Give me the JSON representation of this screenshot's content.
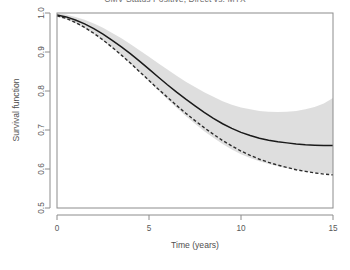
{
  "chart_data": {
    "type": "line",
    "title": "CMV Status Positive, Direct vs. MTX",
    "xlabel": "Time (years)",
    "ylabel": "Survival function",
    "xlim": [
      0,
      15
    ],
    "ylim": [
      0.5,
      1.0
    ],
    "xticks": [
      0,
      5,
      10,
      15
    ],
    "xtick_labels": [
      "0",
      "5",
      "10",
      "15"
    ],
    "yticks": [
      0.5,
      0.6,
      0.7,
      0.8,
      0.9,
      1.0
    ],
    "ytick_labels": [
      "0.5",
      "0.6",
      "0.7",
      "0.8",
      "0.9",
      "1.0"
    ],
    "grid": false,
    "legend": null,
    "x": [
      0,
      0.5,
      1,
      1.5,
      2,
      2.5,
      3,
      3.5,
      4,
      4.5,
      5,
      5.5,
      6,
      6.5,
      7,
      7.5,
      8,
      8.5,
      9,
      9.5,
      10,
      10.5,
      11,
      11.5,
      12,
      12.5,
      13,
      13.5,
      14,
      14.5,
      15
    ],
    "series": [
      {
        "name": "Direct",
        "style": "solid",
        "color": "#1a1a1a",
        "values": [
          0.995,
          0.99,
          0.982,
          0.972,
          0.96,
          0.946,
          0.93,
          0.913,
          0.895,
          0.876,
          0.856,
          0.836,
          0.816,
          0.797,
          0.779,
          0.762,
          0.745,
          0.73,
          0.716,
          0.704,
          0.694,
          0.686,
          0.679,
          0.674,
          0.67,
          0.667,
          0.664,
          0.662,
          0.661,
          0.66,
          0.66
        ]
      },
      {
        "name": "MTX",
        "style": "dashed",
        "color": "#2b2b2b",
        "values": [
          0.993,
          0.986,
          0.976,
          0.963,
          0.948,
          0.931,
          0.912,
          0.892,
          0.871,
          0.849,
          0.827,
          0.805,
          0.784,
          0.763,
          0.743,
          0.724,
          0.706,
          0.689,
          0.673,
          0.659,
          0.646,
          0.635,
          0.625,
          0.617,
          0.61,
          0.604,
          0.598,
          0.594,
          0.59,
          0.587,
          0.585
        ]
      }
    ],
    "confidence_band": {
      "series": "Direct",
      "color": "#d8d8d8",
      "upper": [
        0.999,
        0.996,
        0.99,
        0.983,
        0.973,
        0.962,
        0.949,
        0.935,
        0.92,
        0.904,
        0.888,
        0.871,
        0.855,
        0.839,
        0.824,
        0.81,
        0.797,
        0.785,
        0.774,
        0.765,
        0.758,
        0.753,
        0.749,
        0.747,
        0.746,
        0.747,
        0.749,
        0.753,
        0.759,
        0.768,
        0.782
      ],
      "lower": [
        0.99,
        0.984,
        0.974,
        0.961,
        0.946,
        0.929,
        0.911,
        0.891,
        0.87,
        0.848,
        0.825,
        0.802,
        0.779,
        0.757,
        0.736,
        0.716,
        0.697,
        0.68,
        0.664,
        0.65,
        0.638,
        0.628,
        0.62,
        0.613,
        0.607,
        0.602,
        0.598,
        0.594,
        0.591,
        0.589,
        0.588
      ]
    }
  }
}
